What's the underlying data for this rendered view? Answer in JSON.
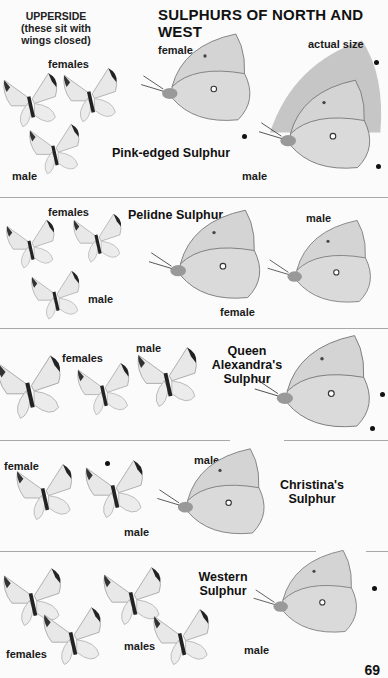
{
  "page": {
    "title": "SULPHURS OF NORTH AND WEST",
    "upperside_note": [
      "UPPERSIDE",
      "(these sit with",
      "wings closed)"
    ],
    "actual_size_label": "actual size",
    "page_number": "69"
  },
  "sections": [
    {
      "species": [
        "Pink-edged Sulphur"
      ],
      "upperside_labels": [
        "females",
        "male"
      ],
      "side_labels": [
        "female",
        "male"
      ]
    },
    {
      "species": [
        "Pelidne Sulphur"
      ],
      "upperside_labels": [
        "females",
        "male"
      ],
      "side_labels": [
        "female",
        "male"
      ]
    },
    {
      "species": [
        "Queen",
        "Alexandra's",
        "Sulphur"
      ],
      "upperside_labels": [
        "females",
        "male"
      ],
      "side_labels": []
    },
    {
      "species": [
        "Christina's",
        "Sulphur"
      ],
      "upperside_labels": [
        "female",
        "male"
      ],
      "side_labels": [
        "male"
      ]
    },
    {
      "species": [
        "Western",
        "Sulphur"
      ],
      "upperside_labels": [
        "females",
        "males"
      ],
      "side_labels": [
        "male"
      ]
    }
  ],
  "colors": {
    "wing_fill": "#e4e4e4",
    "wing_shade": "#cfcfcf",
    "wing_edge": "#222222",
    "separator": "#a8a8a8"
  }
}
